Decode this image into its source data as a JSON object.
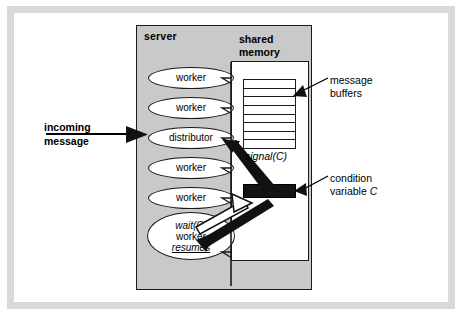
{
  "diagram": {
    "title_labels": {
      "server": "server",
      "shared_memory": "shared\nmemory"
    },
    "server_label": "server",
    "shared_memory_label_line1": "shared",
    "shared_memory_label_line2": "memory",
    "incoming_message_line1": "incoming",
    "incoming_message_line2": "message",
    "processes": [
      {
        "id": "worker-1",
        "label": "worker"
      },
      {
        "id": "worker-2",
        "label": "worker"
      },
      {
        "id": "distributor",
        "label": "distributor"
      },
      {
        "id": "worker-3",
        "label": "worker"
      },
      {
        "id": "worker-4",
        "label": "worker"
      }
    ],
    "waiting_process": {
      "id": "waiting-worker",
      "line1": "wait(C)",
      "line2": "worker",
      "line3": "resumes"
    },
    "message_buffers": {
      "row_count": 8,
      "annotation_line1": "message",
      "annotation_line2": "buffers"
    },
    "condition_variable": {
      "annotation_line1": "condition",
      "annotation_line2_prefix": "variable ",
      "annotation_line2_italic": "C"
    },
    "arrow_labels": {
      "signal": "signal(C)"
    },
    "colors": {
      "server_fill": "#c9c9c9",
      "shared_memory_fill": "#ffffff",
      "condition_variable_fill": "#141414",
      "outline": "#1a1a1a",
      "frame": "#d9d9d9",
      "page_background": "#ffffff"
    }
  }
}
